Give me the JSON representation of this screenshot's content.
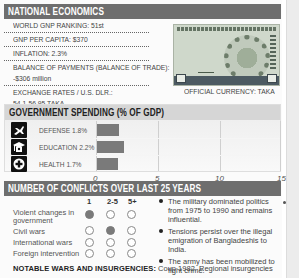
{
  "national_economics": {
    "title": "NATIONAL ECONOMICS",
    "rows": [
      "WORLD GNP RANKING: 51st",
      "GNP PER CAPITA: $370",
      "INFLATION: 2.3%",
      "BALANCE OF PAYMENTS (BALANCE OF TRADE):",
      "-$306 million",
      "EXCHANGE RATES / U.S. DLR.:",
      "54.1-56.95 TAKA"
    ],
    "currency_caption": "OFFICIAL CURRENCY: TAKA"
  },
  "government_spending": {
    "title": "GOVERNMENT SPENDING (% OF GDP)",
    "items": [
      {
        "label": "DEFENSE 1.8%",
        "icon": "fighter-jet-icon"
      },
      {
        "label": "EDUCATION 2.2%",
        "icon": "graduation-cap-icon"
      },
      {
        "label": "HEALTH 1.7%",
        "icon": "medical-cross-icon"
      }
    ],
    "ticks": [
      "0",
      "5",
      "10",
      "15"
    ]
  },
  "chart_data": {
    "type": "bar",
    "title": "GOVERNMENT SPENDING (% OF GDP)",
    "categories": [
      "DEFENSE",
      "EDUCATION",
      "HEALTH"
    ],
    "values": [
      1.8,
      2.2,
      1.7
    ],
    "xlabel": "",
    "ylabel": "% of GDP",
    "xlim": [
      0,
      15
    ],
    "ticks": [
      0,
      5,
      10,
      15
    ],
    "orientation": "horizontal",
    "grid": true
  },
  "conflicts": {
    "title": "NUMBER OF CONFLICTS OVER LAST 25 YEARS",
    "columns": [
      "1",
      "2-5",
      "5+"
    ],
    "rows": [
      {
        "label_line1": "Violent changes in",
        "label_line2": "government",
        "filled": [
          true,
          false,
          false
        ]
      },
      {
        "label_line1": "Civil wars",
        "label_line2": "",
        "filled": [
          false,
          true,
          false
        ]
      },
      {
        "label_line1": "International wars",
        "label_line2": "",
        "filled": [
          false,
          false,
          false
        ]
      },
      {
        "label_line1": "Foreign intervention",
        "label_line2": "",
        "filled": [
          false,
          false,
          false
        ]
      }
    ],
    "bullets": [
      "The military dominated politics from 1975 to 1990 and remains influential.",
      "Tensions persist over the illegal emigration of Bangladeshis to India.",
      "The army has been mobilized to fight crime."
    ]
  },
  "notable": {
    "label": "NOTABLE WARS AND INSURGENCIES:",
    "text": " Coup 1982. Regional insurgencies"
  },
  "colors": {
    "header_dark": "#6e6e6e",
    "header_light": "#d6d6d6",
    "bar": "#7a7a7a",
    "filled_circle": "#7a7a7a"
  }
}
